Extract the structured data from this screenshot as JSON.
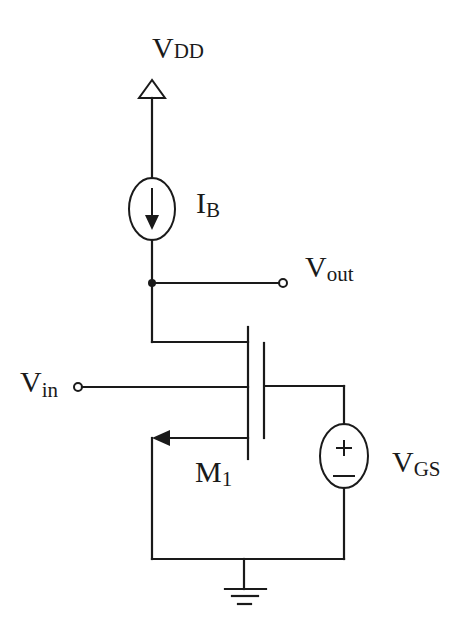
{
  "diagram": {
    "type": "circuit-schematic",
    "stroke_color": "#1a1a1a",
    "background": "#ffffff",
    "labels": {
      "vdd": {
        "main": "V",
        "sub": "DD"
      },
      "ib": {
        "main": "I",
        "sub": "B"
      },
      "vout": {
        "main": "V",
        "sub": "out"
      },
      "vin": {
        "main": "V",
        "sub": "in"
      },
      "m1": {
        "main": "M",
        "sub": "1"
      },
      "vgs": {
        "main": "V",
        "sub": "GS"
      }
    },
    "components": [
      {
        "id": "vdd",
        "kind": "supply-rail",
        "label": "VDD"
      },
      {
        "id": "ib",
        "kind": "current-source",
        "label": "IB",
        "direction": "down"
      },
      {
        "id": "vout",
        "kind": "output-terminal",
        "label": "Vout"
      },
      {
        "id": "m1",
        "kind": "nmos-transistor",
        "label": "M1"
      },
      {
        "id": "vin",
        "kind": "input-terminal",
        "label": "Vin"
      },
      {
        "id": "vgs",
        "kind": "voltage-source",
        "label": "VGS",
        "polarity": [
          "+",
          "−"
        ]
      },
      {
        "id": "gnd",
        "kind": "ground"
      }
    ],
    "vgs_symbols": {
      "plus": "+",
      "minus": "−"
    }
  }
}
